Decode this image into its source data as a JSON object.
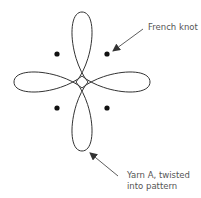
{
  "diagram": {
    "labels": {
      "french_knot": "French knot",
      "yarn_line1": "Yarn A, twisted",
      "yarn_line2": "into pattern"
    },
    "colors": {
      "stroke": "#333333",
      "text": "#555555",
      "background": "#ffffff"
    },
    "knots": [
      {
        "x": 57,
        "y": 54
      },
      {
        "x": 107,
        "y": 54
      },
      {
        "x": 57,
        "y": 107
      },
      {
        "x": 107,
        "y": 107
      }
    ]
  }
}
